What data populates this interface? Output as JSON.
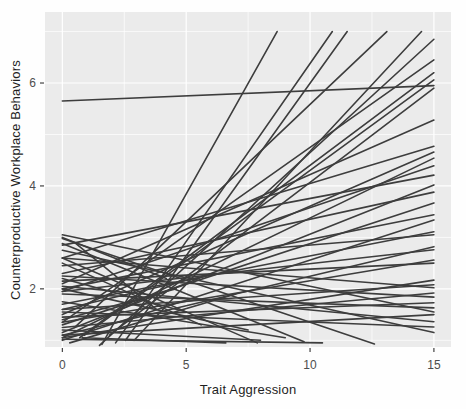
{
  "figure": {
    "kind": "ggplot-style spaghetti plot of per-person regression lines"
  },
  "chart_data": {
    "type": "line",
    "title": "",
    "xlabel": "Trait Aggression",
    "ylabel": "Counterproductive Workplace Behaviors",
    "x_ticks": [
      0,
      5,
      10,
      15
    ],
    "y_ticks": [
      2,
      4,
      6
    ],
    "x_minor": [
      2.5,
      7.5,
      12.5
    ],
    "y_minor": [
      1,
      3,
      5,
      7
    ],
    "xlim": [
      -0.7,
      15.69
    ],
    "ylim": [
      0.87,
      7.38
    ],
    "grid": true,
    "legend": "none",
    "panel_bg": "#ebebeb",
    "grid_color": "#ffffff",
    "line_color": "#3d3d3d",
    "tick_label_color": "#4d4d4d",
    "line_width": 1.6,
    "lines": [
      [
        1.6,
        0.92,
        8.67,
        7.0
      ],
      [
        2.15,
        0.95,
        10.9,
        7.0
      ],
      [
        2.55,
        1.0,
        11.5,
        7.0
      ],
      [
        0.5,
        1.25,
        13.1,
        7.0
      ],
      [
        2.9,
        1.0,
        14.5,
        7.0
      ],
      [
        1.5,
        0.9,
        15,
        6.85
      ],
      [
        0.0,
        1.35,
        15,
        6.45
      ],
      [
        0.7,
        1.05,
        15,
        6.2
      ],
      [
        0.9,
        1.1,
        15,
        6.06
      ],
      [
        1.9,
        1.1,
        15,
        5.9
      ],
      [
        0.0,
        5.65,
        15,
        5.95
      ],
      [
        0.0,
        2.1,
        15,
        5.28
      ],
      [
        0.0,
        2.6,
        15,
        4.77
      ],
      [
        0.0,
        1.5,
        15,
        4.66
      ],
      [
        0.0,
        1.05,
        15,
        4.54
      ],
      [
        0.0,
        1.95,
        15,
        4.39
      ],
      [
        0.0,
        2.85,
        15,
        4.21
      ],
      [
        0.0,
        1.15,
        15,
        4.02
      ],
      [
        0.0,
        2.3,
        15,
        3.88
      ],
      [
        0.0,
        1.3,
        15,
        3.67
      ],
      [
        0.0,
        2.0,
        15,
        3.44
      ],
      [
        0.0,
        1.0,
        15,
        3.34
      ],
      [
        0.0,
        1.7,
        15,
        3.11
      ],
      [
        0.0,
        2.45,
        15,
        3.05
      ],
      [
        0.0,
        1.1,
        15,
        2.82
      ],
      [
        0.0,
        1.95,
        15,
        2.76
      ],
      [
        0.0,
        1.35,
        15,
        2.56
      ],
      [
        0.0,
        2.15,
        15,
        2.5
      ],
      [
        0.0,
        1.05,
        15,
        2.17
      ],
      [
        0.0,
        1.6,
        15,
        2.08
      ],
      [
        0.0,
        2.6,
        15,
        2.02
      ],
      [
        0.0,
        1.25,
        15,
        1.92
      ],
      [
        0.0,
        2.25,
        15,
        1.84
      ],
      [
        0.0,
        1.45,
        15,
        1.73
      ],
      [
        0.0,
        1.9,
        15,
        1.63
      ],
      [
        0.0,
        1.1,
        15,
        1.5
      ],
      [
        0.0,
        2.05,
        15,
        1.36
      ],
      [
        0.0,
        1.55,
        15,
        1.26
      ],
      [
        0.0,
        2.75,
        15,
        1.15
      ],
      [
        0.0,
        2.6,
        7.87,
        0.95
      ],
      [
        0.0,
        2.88,
        9.76,
        0.97
      ],
      [
        0.0,
        2.98,
        12.6,
        0.93
      ],
      [
        0.0,
        3.05,
        15,
        1.55
      ],
      [
        0.0,
        2.5,
        5.6,
        1.3
      ],
      [
        0.0,
        1.6,
        6.2,
        2.3
      ],
      [
        0.0,
        3.0,
        4.2,
        2.2
      ],
      [
        0.3,
        0.95,
        7.0,
        1.9
      ],
      [
        0.8,
        1.05,
        6.6,
        0.95
      ],
      [
        0.0,
        2.2,
        5.0,
        1.55
      ],
      [
        0.0,
        1.4,
        4.6,
        2.0
      ],
      [
        0.0,
        2.0,
        7.5,
        1.2
      ],
      [
        0.0,
        1.2,
        8.0,
        1.0
      ],
      [
        0.5,
        2.9,
        3.8,
        1.6
      ],
      [
        0.0,
        1.75,
        9.0,
        1.05
      ],
      [
        0.0,
        1.02,
        10.5,
        0.95
      ]
    ]
  }
}
